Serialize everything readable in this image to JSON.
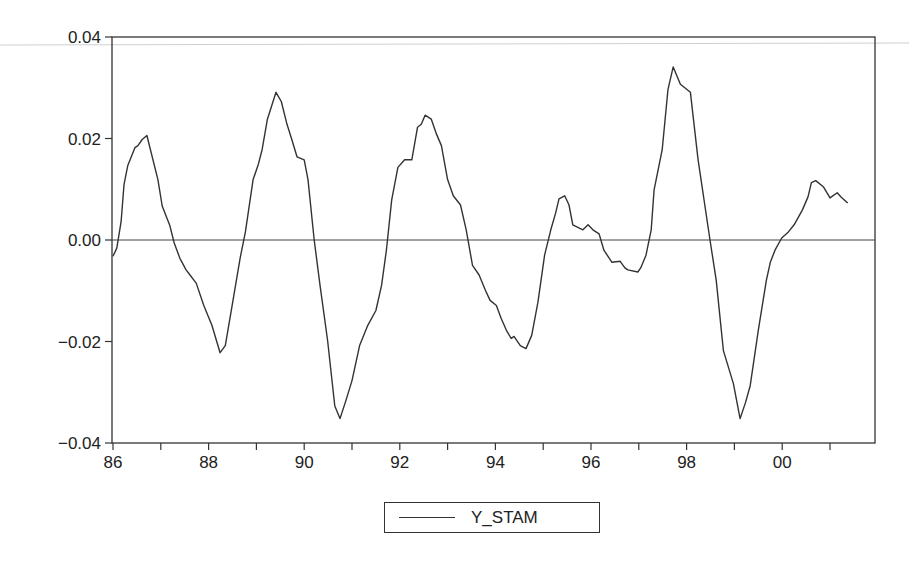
{
  "chart_data": {
    "type": "line",
    "title": "",
    "xlabel": "",
    "ylabel": "",
    "x_tick_labels": [
      "86",
      "88",
      "90",
      "92",
      "94",
      "96",
      "98",
      "00"
    ],
    "x_minor_ticks_every": "1 year",
    "y_tick_labels": [
      "0.04",
      "0.02",
      "0.00",
      "−0.02",
      "−0.04"
    ],
    "y_ticks": [
      0.04,
      0.02,
      0.0,
      -0.02,
      -0.04
    ],
    "ylim": [
      -0.04,
      0.04
    ],
    "xlim": [
      1986.0,
      2001.9
    ],
    "grid": false,
    "reference_line": 0.0,
    "legend_position": "bottom-center",
    "series": [
      {
        "name": "Y_STAM",
        "color": "#333333",
        "x": [
          1986.0,
          1986.08,
          1986.17,
          1986.23,
          1986.31,
          1986.46,
          1986.52,
          1986.61,
          1986.71,
          1986.94,
          1987.03,
          1987.19,
          1987.28,
          1987.4,
          1987.53,
          1987.61,
          1987.74,
          1987.9,
          1988.07,
          1988.24,
          1988.35,
          1988.51,
          1988.66,
          1988.77,
          1988.93,
          1989.04,
          1989.12,
          1989.23,
          1989.41,
          1989.52,
          1989.64,
          1989.74,
          1989.85,
          1990.0,
          1990.08,
          1990.21,
          1990.33,
          1990.49,
          1990.64,
          1990.75,
          1990.87,
          1991.0,
          1991.16,
          1991.33,
          1991.5,
          1991.62,
          1991.72,
          1991.83,
          1991.96,
          1992.1,
          1992.25,
          1992.37,
          1992.45,
          1992.53,
          1992.66,
          1992.77,
          1992.87,
          1993.0,
          1993.12,
          1993.27,
          1993.39,
          1993.52,
          1993.66,
          1993.79,
          1993.89,
          1994.02,
          1994.12,
          1994.23,
          1994.33,
          1994.39,
          1994.52,
          1994.64,
          1994.76,
          1994.89,
          1995.03,
          1995.16,
          1995.26,
          1995.33,
          1995.45,
          1995.54,
          1995.62,
          1995.83,
          1995.94,
          1996.04,
          1996.17,
          1996.27,
          1996.44,
          1996.61,
          1996.71,
          1996.77,
          1996.98,
          1997.04,
          1997.15,
          1997.26,
          1997.32,
          1997.49,
          1997.61,
          1997.72,
          1997.87,
          1998.08,
          1998.24,
          1998.49,
          1998.62,
          1998.77,
          1998.98,
          1999.12,
          1999.23,
          1999.33,
          1999.5,
          1999.67,
          1999.75,
          1999.85,
          1999.99,
          2000.13,
          2000.25,
          2000.42,
          2000.54,
          2000.61,
          2000.7,
          2000.86,
          2001.0,
          2001.15,
          2001.23,
          2001.37
        ],
        "values": [
          -0.0032,
          -0.0016,
          0.0036,
          0.0109,
          0.0147,
          0.0182,
          0.0186,
          0.0198,
          0.0206,
          0.0119,
          0.0067,
          0.0028,
          -0.0006,
          -0.0036,
          -0.0059,
          -0.0069,
          -0.0085,
          -0.0129,
          -0.0168,
          -0.0222,
          -0.0208,
          -0.0119,
          -0.0036,
          0.0016,
          0.0119,
          0.0149,
          0.0178,
          0.0238,
          0.0291,
          0.0273,
          0.0228,
          0.0198,
          0.0164,
          0.0158,
          0.0119,
          0.0,
          -0.0089,
          -0.0198,
          -0.0327,
          -0.0352,
          -0.0317,
          -0.0277,
          -0.0208,
          -0.0168,
          -0.0139,
          -0.0089,
          -0.002,
          0.0079,
          0.0143,
          0.0158,
          0.0158,
          0.0222,
          0.0228,
          0.0246,
          0.0238,
          0.0208,
          0.0186,
          0.0119,
          0.0087,
          0.0069,
          0.002,
          -0.005,
          -0.0069,
          -0.0099,
          -0.0119,
          -0.0129,
          -0.0154,
          -0.0178,
          -0.0194,
          -0.019,
          -0.0208,
          -0.0214,
          -0.0188,
          -0.0123,
          -0.003,
          0.002,
          0.0053,
          0.0081,
          0.0087,
          0.0069,
          0.003,
          0.002,
          0.003,
          0.002,
          0.0012,
          -0.002,
          -0.0044,
          -0.0042,
          -0.0055,
          -0.0059,
          -0.0063,
          -0.0055,
          -0.003,
          0.002,
          0.0099,
          0.0178,
          0.0297,
          0.0341,
          0.0307,
          0.0291,
          0.0158,
          0.0,
          -0.0079,
          -0.0218,
          -0.0283,
          -0.0352,
          -0.0321,
          -0.0287,
          -0.0178,
          -0.0079,
          -0.0044,
          -0.002,
          0.0004,
          0.0016,
          0.003,
          0.0059,
          0.0085,
          0.0113,
          0.0117,
          0.0105,
          0.0083,
          0.0093,
          0.0085,
          0.0073
        ]
      }
    ]
  },
  "legend": {
    "items": [
      {
        "label": "Y_STAM"
      }
    ]
  }
}
